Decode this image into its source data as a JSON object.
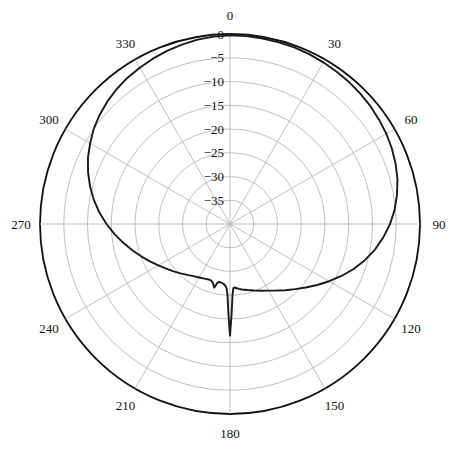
{
  "chart_data": {
    "type": "line",
    "plot_kind": "polar-radiation-pattern",
    "title": "",
    "xlabel": "",
    "ylabel": "",
    "angle_unit": "degrees",
    "radial_unit": "dB",
    "angle_direction": "clockwise",
    "angle_zero_at": "top",
    "angle_ticks": [
      0,
      30,
      60,
      90,
      120,
      150,
      180,
      210,
      240,
      270,
      300,
      330
    ],
    "angle_tick_labels": [
      "0",
      "30",
      "60",
      "90",
      "120",
      "150",
      "180",
      "210",
      "240",
      "270",
      "300",
      "330"
    ],
    "radial_ticks": [
      0,
      -5,
      -10,
      -15,
      -20,
      -25,
      -30,
      -35
    ],
    "radial_tick_labels": [
      "0",
      "−5",
      "−10",
      "−15",
      "−20",
      "−25",
      "−30",
      "−35"
    ],
    "rlim": [
      -40,
      0
    ],
    "grid": true,
    "legend": false,
    "series": [
      {
        "name": "pattern",
        "color": "#1a1a1a",
        "theta": [
          0,
          5,
          10,
          15,
          20,
          25,
          30,
          35,
          40,
          45,
          50,
          55,
          60,
          65,
          70,
          75,
          80,
          85,
          90,
          95,
          100,
          105,
          110,
          115,
          120,
          125,
          130,
          135,
          140,
          145,
          150,
          155,
          160,
          165,
          170,
          172,
          174,
          176,
          177,
          178,
          179,
          180,
          181,
          182,
          183,
          184,
          186,
          188,
          190,
          192,
          194,
          196,
          198,
          200,
          205,
          210,
          215,
          220,
          225,
          230,
          235,
          240,
          245,
          250,
          255,
          260,
          265,
          270,
          275,
          280,
          285,
          290,
          295,
          300,
          305,
          310,
          315,
          320,
          325,
          330,
          335,
          340,
          345,
          350,
          355,
          360
        ],
        "values": [
          -0.3,
          -0.3,
          -0.35,
          -0.4,
          -0.45,
          -0.55,
          -0.7,
          -0.85,
          -1.0,
          -1.2,
          -1.4,
          -1.7,
          -2.0,
          -2.4,
          -2.9,
          -3.5,
          -4.3,
          -5.2,
          -6.3,
          -7.6,
          -9.0,
          -10.6,
          -12.3,
          -14.1,
          -15.9,
          -17.6,
          -19.2,
          -20.6,
          -21.8,
          -22.9,
          -23.8,
          -24.5,
          -25.1,
          -25.6,
          -26.0,
          -26.2,
          -26.4,
          -26.6,
          -26.5,
          -25.0,
          -21.0,
          -16.5,
          -21.0,
          -25.0,
          -26.4,
          -26.9,
          -27.3,
          -27.5,
          -27.6,
          -27.4,
          -26.2,
          -27.0,
          -27.4,
          -27.5,
          -27.3,
          -27.0,
          -26.6,
          -26.0,
          -25.3,
          -24.5,
          -23.6,
          -22.6,
          -21.4,
          -20.1,
          -18.7,
          -17.2,
          -15.6,
          -14.0,
          -12.4,
          -10.9,
          -9.5,
          -8.2,
          -7.0,
          -6.0,
          -5.0,
          -4.2,
          -3.5,
          -2.9,
          -2.4,
          -2.0,
          -1.6,
          -1.2,
          -0.9,
          -0.6,
          -0.4,
          -0.3
        ]
      }
    ]
  },
  "labels": {
    "angles": [
      {
        "text": "0",
        "deg": 0
      },
      {
        "text": "30",
        "deg": 30
      },
      {
        "text": "60",
        "deg": 60
      },
      {
        "text": "90",
        "deg": 90
      },
      {
        "text": "120",
        "deg": 120
      },
      {
        "text": "150",
        "deg": 150
      },
      {
        "text": "180",
        "deg": 180
      },
      {
        "text": "210",
        "deg": 210
      },
      {
        "text": "240",
        "deg": 240
      },
      {
        "text": "270",
        "deg": 270
      },
      {
        "text": "300",
        "deg": 300
      },
      {
        "text": "330",
        "deg": 330
      }
    ],
    "radials": [
      {
        "text": "0",
        "value": 0
      },
      {
        "text": "−5",
        "value": -5
      },
      {
        "text": "−10",
        "value": -10
      },
      {
        "text": "−15",
        "value": -15
      },
      {
        "text": "−20",
        "value": -20
      },
      {
        "text": "−25",
        "value": -25
      },
      {
        "text": "−30",
        "value": -30
      },
      {
        "text": "−35",
        "value": -35
      }
    ]
  },
  "style": {
    "background": "#ffffff",
    "grid_color": "#b9b9b9",
    "outer_ring_color": "#111111",
    "curve_color": "#1a1a1a",
    "text_color": "#111111"
  },
  "geometry": {
    "center_x": 230,
    "center_y": 224,
    "outer_radius": 190
  }
}
